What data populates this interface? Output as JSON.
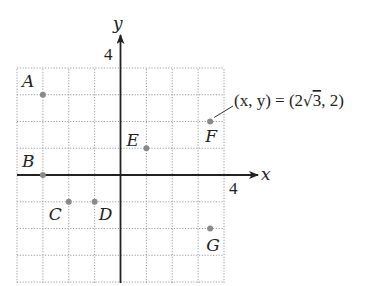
{
  "diagram": {
    "type": "coordinate-plane",
    "grid": {
      "x_min": -4,
      "x_max": 4,
      "y_min": -4,
      "y_max": 4,
      "style": "dotted"
    },
    "axes": {
      "x_label": "x",
      "y_label": "y",
      "x_tick_label": "4",
      "y_tick_label": "4"
    },
    "points": [
      {
        "name": "A",
        "x": -3,
        "y": 3
      },
      {
        "name": "B",
        "x": -3,
        "y": 0
      },
      {
        "name": "C",
        "x": -2,
        "y": -1
      },
      {
        "name": "D",
        "x": -1,
        "y": -1
      },
      {
        "name": "E",
        "x": 1,
        "y": 1
      },
      {
        "name": "F",
        "x": 3.464,
        "y": 2
      },
      {
        "name": "G",
        "x": 3.464,
        "y": -2
      }
    ],
    "annotation": {
      "target": "F",
      "text_prefix": "(x, y) = (2",
      "radical": "√",
      "radicand": "3",
      "text_suffix": ", 2)"
    },
    "colors": {
      "point": "#8a8a8a",
      "axis": "#222222",
      "grid": "#9a9a9a"
    }
  }
}
